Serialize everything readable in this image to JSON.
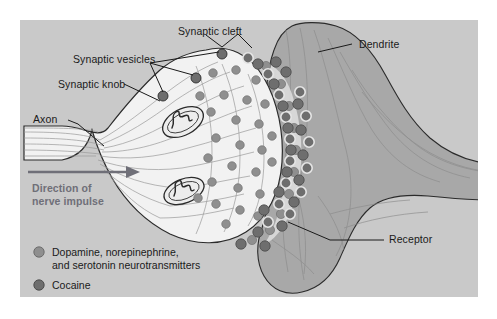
{
  "figure": {
    "background_color": "#ffffff",
    "panel_color": "#c9c9c9",
    "knob_color": "#f2f2f2",
    "dendrite_color": "#a8a8a8",
    "cleft_color": "#dcdcdc",
    "neurotransmitter_color": "#8f8f8f",
    "cocaine_color": "#6e6e6e",
    "vesicle_color": "#6e6e6e",
    "outline_color": "#2b2b2b"
  },
  "labels": {
    "synaptic_cleft": "Synaptic cleft",
    "synaptic_vesicles": "Synaptic vesicles",
    "synaptic_knob": "Synaptic knob",
    "axon": "Axon",
    "dendrite": "Dendrite",
    "receptor": "Receptor",
    "direction_line1": "Direction of",
    "direction_line2": "nerve impulse"
  },
  "legend": {
    "items": [
      {
        "marker": "neurotransmitter-dot",
        "color": "#8f8f8f",
        "line1": "Dopamine, norepinephrine,",
        "line2": "and serotonin neurotransmitters"
      },
      {
        "marker": "cocaine-dot",
        "color": "#6e6e6e",
        "line1": "Cocaine",
        "line2": ""
      }
    ]
  },
  "structures": {
    "axon_label": "Axon",
    "knob_label": "Synaptic knob",
    "cleft_label": "Synaptic cleft",
    "dendrite_label": "Dendrite",
    "receptor_label": "Receptor"
  }
}
